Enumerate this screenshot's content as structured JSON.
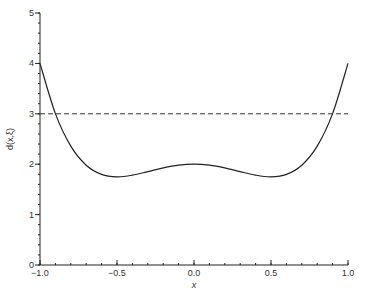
{
  "chart_data": {
    "type": "line",
    "title": "",
    "xlabel": "x",
    "ylabel": "d(x,ξ)",
    "xlim": [
      -1.0,
      1.0
    ],
    "ylim": [
      0,
      5
    ],
    "grid": false,
    "legend": "none",
    "x_ticks": [
      {
        "value": -1.0,
        "label": "−1.0"
      },
      {
        "value": -0.5,
        "label": "−0.5"
      },
      {
        "value": 0.0,
        "label": "0.0"
      },
      {
        "value": 0.5,
        "label": "0.5"
      },
      {
        "value": 1.0,
        "label": "1.0"
      }
    ],
    "x_minor_step": 0.1,
    "y_ticks": [
      {
        "value": 0,
        "label": "0"
      },
      {
        "value": 1,
        "label": "1"
      },
      {
        "value": 2,
        "label": "2"
      },
      {
        "value": 3,
        "label": "3"
      },
      {
        "value": 4,
        "label": "4"
      },
      {
        "value": 5,
        "label": "5"
      }
    ],
    "y_minor_step": 0.2,
    "series": [
      {
        "name": "d(x,ξ)",
        "style": "solid",
        "x": [
          -1.0,
          -0.9,
          -0.8,
          -0.7,
          -0.6,
          -0.5,
          -0.4,
          -0.3,
          -0.2,
          -0.1,
          0.0,
          0.1,
          0.2,
          0.3,
          0.4,
          0.5,
          0.6,
          0.7,
          0.8,
          0.9,
          1.0
        ],
        "y": [
          4.0,
          3.004,
          2.358,
          1.98,
          1.798,
          1.75,
          1.782,
          1.852,
          1.926,
          1.98,
          2.0,
          1.98,
          1.926,
          1.852,
          1.782,
          1.75,
          1.798,
          1.98,
          2.358,
          3.004,
          4.0
        ]
      },
      {
        "name": "reference",
        "style": "dashed",
        "x": [
          -1.0,
          1.0
        ],
        "y": [
          3.0,
          3.0
        ]
      }
    ]
  }
}
